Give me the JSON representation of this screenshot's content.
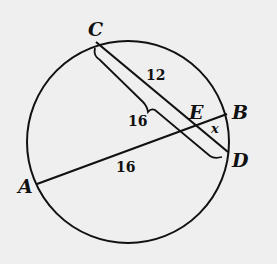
{
  "diagram": {
    "type": "circle-intersecting-chords",
    "circle": {
      "cx": 128,
      "cy": 142,
      "r": 101
    },
    "points": {
      "C": {
        "label": "C",
        "x": 96,
        "y": 42
      },
      "D": {
        "label": "D",
        "x": 228,
        "y": 152
      },
      "B": {
        "label": "B",
        "x": 227,
        "y": 114
      },
      "A": {
        "label": "A",
        "x": 37,
        "y": 184
      },
      "E": {
        "label": "E",
        "x": 193,
        "y": 126
      }
    },
    "segments": [
      {
        "from": "C",
        "to": "D"
      },
      {
        "from": "A",
        "to": "B"
      }
    ],
    "measures": {
      "CE": "12",
      "CD_brace": "16",
      "AE": "16",
      "EB": "x"
    },
    "colors": {
      "stroke": "#111111",
      "background": "#efefef"
    }
  }
}
